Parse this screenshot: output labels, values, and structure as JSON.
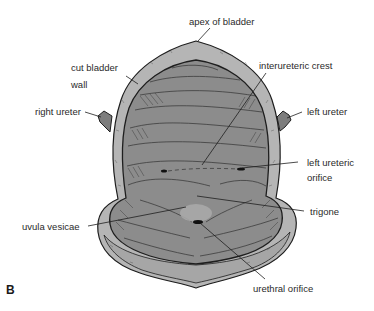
{
  "figure": {
    "panel_letter": "B",
    "colors": {
      "interior": "#8c8c8c",
      "wall": "#b5b5b5",
      "outline": "#1e1e1e",
      "ureter": "#7d7d7d",
      "uvula": "#a8a8a8",
      "label_text": "#2a2a2a"
    }
  },
  "labels": {
    "apex": "apex of bladder",
    "cut_wall_line1": "cut bladder",
    "cut_wall_line2": "wall",
    "interureteric_crest": "interureteric crest",
    "right_ureter": "right ureter",
    "left_ureter": "left ureter",
    "left_ureteric_orifice_line1": "left ureteric",
    "left_ureteric_orifice_line2": "orifice",
    "trigone": "trigone",
    "uvula_vesicae": "uvula vesicae",
    "urethral_orifice": "urethral orifice"
  }
}
